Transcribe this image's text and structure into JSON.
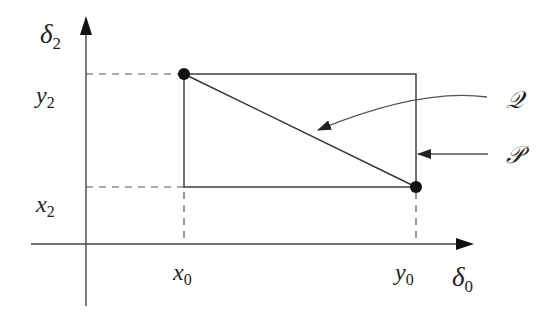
{
  "diagram": {
    "axes": {
      "vertical": {
        "label": "δ",
        "subscript": "2"
      },
      "horizontal": {
        "label": "δ",
        "subscript": "0"
      }
    },
    "ticks": {
      "y_upper": {
        "label": "y",
        "subscript": "2"
      },
      "y_lower": {
        "label": "x",
        "subscript": "2"
      },
      "x_left": {
        "label": "x",
        "subscript": "0"
      },
      "x_right": {
        "label": "y",
        "subscript": "0"
      }
    },
    "points": [
      {
        "name": "top-left",
        "x_tick": "x0",
        "y_tick": "y2"
      },
      {
        "name": "bottom-right",
        "x_tick": "y0",
        "y_tick": "x2"
      }
    ],
    "annotations": {
      "q": {
        "label": "𝒬",
        "target": "diagonal segment"
      },
      "p": {
        "label": "𝒫",
        "target": "rectangle"
      }
    },
    "colors": {
      "ink": "#222222",
      "background": "#ffffff"
    }
  }
}
